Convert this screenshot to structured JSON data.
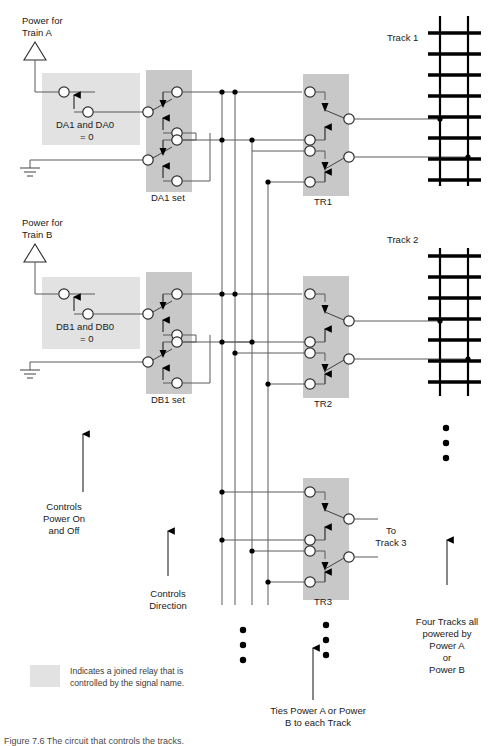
{
  "figure": {
    "caption": "Figure 7.6 The circuit that controls the tracks.",
    "legend_text_line1": "Indicates a joined relay that is",
    "legend_text_line2": "controlled by the signal name."
  },
  "power_sources": [
    {
      "id": "power-a",
      "line1": "Power for",
      "line2": "Train A"
    },
    {
      "id": "power-b",
      "line1": "Power for",
      "line2": "Train B"
    }
  ],
  "enable_relays": [
    {
      "id": "da-enable",
      "line1": "DA1 and DA0",
      "line2": "= 0"
    },
    {
      "id": "db-enable",
      "line1": "DB1 and DB0",
      "line2": "= 0"
    }
  ],
  "direction_relays": [
    {
      "id": "da1-set",
      "label": "DA1 set"
    },
    {
      "id": "db1-set",
      "label": "DB1 set"
    }
  ],
  "track_relays": [
    {
      "id": "tr1",
      "label": "TR1"
    },
    {
      "id": "tr2",
      "label": "TR2"
    },
    {
      "id": "tr3",
      "label": "TR3"
    }
  ],
  "tracks": [
    {
      "id": "track-1",
      "label": "Track 1"
    },
    {
      "id": "track-2",
      "label": "Track 2"
    }
  ],
  "annotations": [
    {
      "id": "controls-power",
      "lines": [
        "Controls",
        "Power On",
        "and Off"
      ]
    },
    {
      "id": "controls-direction",
      "lines": [
        "Controls",
        "Direction"
      ]
    },
    {
      "id": "to-track-3",
      "lines": [
        "To",
        "Track 3"
      ]
    },
    {
      "id": "ties-power",
      "lines": [
        "Ties Power A or Power",
        "B to each Track"
      ]
    },
    {
      "id": "four-tracks",
      "lines": [
        "Four Tracks all",
        "powered by",
        "Power A",
        "or",
        "Power B"
      ]
    }
  ],
  "colors": {
    "relay_shade_dark": "#c8c8c8",
    "relay_shade_light": "#e2e2e2",
    "wire": "#5a5a5a",
    "node_fill": "#ffffff",
    "node_stroke": "#2b2b2b",
    "rail": "#000000",
    "text": "#1a1a1a"
  }
}
